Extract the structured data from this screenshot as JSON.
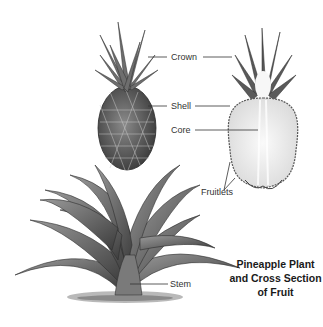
{
  "title": {
    "lines": [
      "Pineapple Plant",
      "and Cross Section",
      "of Fruit"
    ]
  },
  "labels": {
    "crown": "Crown",
    "shell": "Shell",
    "core": "Core",
    "fruitlets": "Fruitlets",
    "stem": "Stem"
  },
  "colors": {
    "background": "#ffffff",
    "ink": "#333333",
    "foliage_dark": "#3a3a3a",
    "foliage_mid": "#7a7a7a",
    "flesh": "#efefef"
  }
}
